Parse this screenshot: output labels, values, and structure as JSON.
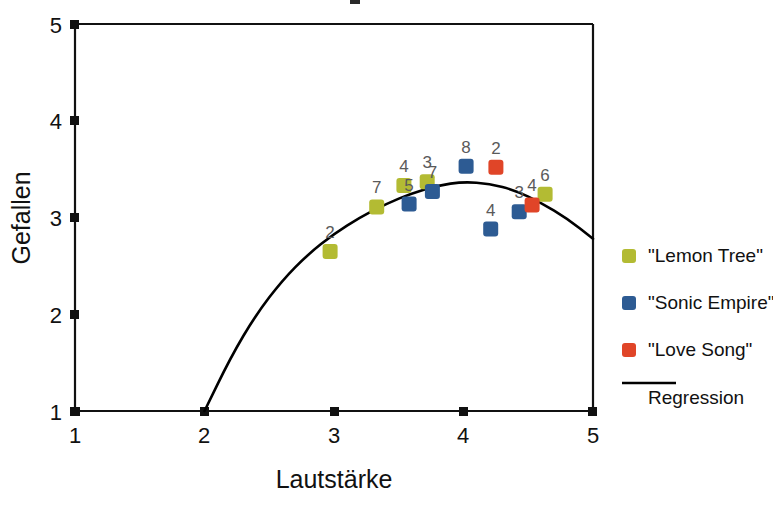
{
  "chart_data": {
    "type": "scatter",
    "title": "",
    "xlabel": "Lautstärke",
    "ylabel": "Gefallen",
    "xlim": [
      1,
      5
    ],
    "ylim": [
      1,
      5
    ],
    "xticks": [
      "1",
      "2",
      "3",
      "4",
      "5"
    ],
    "yticks": [
      "1",
      "2",
      "3",
      "4",
      "5"
    ],
    "grid": false,
    "legend_position": "right",
    "series": [
      {
        "name": "\"Lemon Tree\"",
        "color": "#b3bb33",
        "marker": "square",
        "points": [
          {
            "x": 2.97,
            "y": 2.65,
            "label": "2"
          },
          {
            "x": 3.33,
            "y": 3.11,
            "label": "7"
          },
          {
            "x": 3.54,
            "y": 3.33,
            "label": "4"
          },
          {
            "x": 3.72,
            "y": 3.37,
            "label": "3"
          },
          {
            "x": 4.63,
            "y": 3.24,
            "label": "6"
          }
        ]
      },
      {
        "name": "\"Sonic Empire\"",
        "color": "#2d5b93",
        "marker": "square",
        "points": [
          {
            "x": 3.58,
            "y": 3.14,
            "label": "5"
          },
          {
            "x": 3.76,
            "y": 3.27,
            "label": "7"
          },
          {
            "x": 4.02,
            "y": 3.53,
            "label": "8"
          },
          {
            "x": 4.21,
            "y": 2.88,
            "label": "4"
          },
          {
            "x": 4.43,
            "y": 3.06,
            "label": "3"
          }
        ]
      },
      {
        "name": "\"Love Song\"",
        "color": "#e04528",
        "marker": "square",
        "points": [
          {
            "x": 4.25,
            "y": 3.52,
            "label": "2"
          },
          {
            "x": 4.53,
            "y": 3.13,
            "label": "4"
          }
        ]
      }
    ],
    "regression": {
      "name": "Regression",
      "color": "#000000",
      "description": "quadratic fit peaking near x=3.95, y=3.37, starting at (2,1) and ending at (5,2.78)",
      "points": [
        {
          "x": 2.0,
          "y": 1.0
        },
        {
          "x": 2.2,
          "y": 1.55
        },
        {
          "x": 2.4,
          "y": 2.0
        },
        {
          "x": 2.6,
          "y": 2.35
        },
        {
          "x": 2.8,
          "y": 2.62
        },
        {
          "x": 3.0,
          "y": 2.83
        },
        {
          "x": 3.2,
          "y": 3.0
        },
        {
          "x": 3.4,
          "y": 3.14
        },
        {
          "x": 3.6,
          "y": 3.25
        },
        {
          "x": 3.8,
          "y": 3.33
        },
        {
          "x": 4.0,
          "y": 3.37
        },
        {
          "x": 4.2,
          "y": 3.35
        },
        {
          "x": 4.4,
          "y": 3.28
        },
        {
          "x": 4.6,
          "y": 3.15
        },
        {
          "x": 4.8,
          "y": 2.99
        },
        {
          "x": 5.0,
          "y": 2.78
        }
      ]
    }
  },
  "legend": {
    "entries": [
      {
        "label": "\"Lemon Tree\"",
        "color": "#b3bb33",
        "type": "marker"
      },
      {
        "label": "\"Sonic Empire\"",
        "color": "#2d5b93",
        "type": "marker"
      },
      {
        "label": "\"Love Song\"",
        "color": "#e04528",
        "type": "marker"
      },
      {
        "label": "Regression",
        "color": "#000000",
        "type": "line"
      }
    ]
  },
  "axes": {
    "x_title": "Lautstärke",
    "y_title": "Gefallen"
  }
}
